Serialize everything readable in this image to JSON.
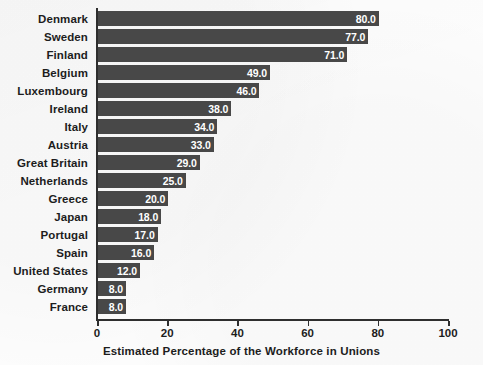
{
  "chart_data": {
    "type": "bar",
    "orientation": "horizontal",
    "title": "",
    "xlabel": "Estimated Percentage of the Workforce in Unions",
    "ylabel": "",
    "xlim": [
      0,
      100
    ],
    "xticks": [
      0,
      20,
      40,
      60,
      80,
      100
    ],
    "xtick_labels": [
      "0",
      "20",
      "40",
      "60",
      "80",
      "100"
    ],
    "grid": false,
    "legend": false,
    "bar_color": "#484848",
    "value_label_color": "#ffffff",
    "categories": [
      "Denmark",
      "Sweden",
      "Finland",
      "Belgium",
      "Luxembourg",
      "Ireland",
      "Italy",
      "Austria",
      "Great Britain",
      "Netherlands",
      "Greece",
      "Japan",
      "Portugal",
      "Spain",
      "United States",
      "Germany",
      "France"
    ],
    "values": [
      80.0,
      77.0,
      71.0,
      49.0,
      46.0,
      38.0,
      34.0,
      33.0,
      29.0,
      25.0,
      20.0,
      18.0,
      17.0,
      16.0,
      12.0,
      8.0,
      8.0
    ],
    "value_labels": [
      "80.0",
      "77.0",
      "71.0",
      "49.0",
      "46.0",
      "38.0",
      "34.0",
      "33.0",
      "29.0",
      "25.0",
      "20.0",
      "18.0",
      "17.0",
      "16.0",
      "12.0",
      "8.0",
      "8.0"
    ],
    "bars": [
      {
        "category": "Denmark",
        "value": 80.0,
        "label": "80.0"
      },
      {
        "category": "Sweden",
        "value": 77.0,
        "label": "77.0"
      },
      {
        "category": "Finland",
        "value": 71.0,
        "label": "71.0"
      },
      {
        "category": "Belgium",
        "value": 49.0,
        "label": "49.0"
      },
      {
        "category": "Luxembourg",
        "value": 46.0,
        "label": "46.0"
      },
      {
        "category": "Ireland",
        "value": 38.0,
        "label": "38.0"
      },
      {
        "category": "Italy",
        "value": 34.0,
        "label": "34.0"
      },
      {
        "category": "Austria",
        "value": 33.0,
        "label": "33.0"
      },
      {
        "category": "Great Britain",
        "value": 29.0,
        "label": "29.0"
      },
      {
        "category": "Netherlands",
        "value": 25.0,
        "label": "25.0"
      },
      {
        "category": "Greece",
        "value": 20.0,
        "label": "20.0"
      },
      {
        "category": "Japan",
        "value": 18.0,
        "label": "18.0"
      },
      {
        "category": "Portugal",
        "value": 17.0,
        "label": "17.0"
      },
      {
        "category": "Spain",
        "value": 16.0,
        "label": "16.0"
      },
      {
        "category": "United States",
        "value": 12.0,
        "label": "12.0"
      },
      {
        "category": "Germany",
        "value": 8.0,
        "label": "8.0"
      },
      {
        "category": "France",
        "value": 8.0,
        "label": "8.0"
      }
    ]
  }
}
